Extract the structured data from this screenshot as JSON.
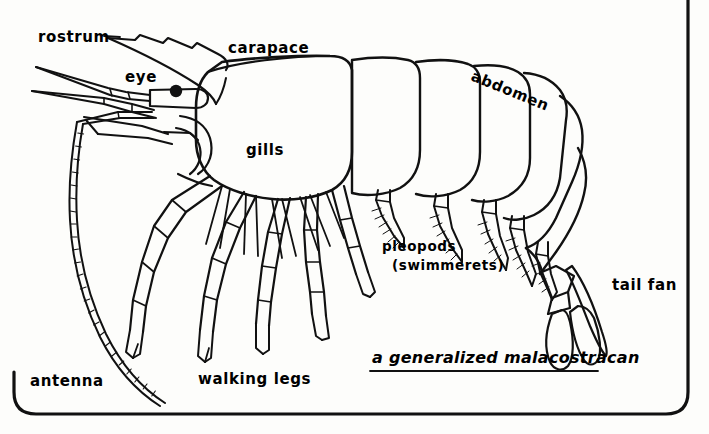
{
  "figure": {
    "caption": "a generalized malacostracan",
    "caption_underlined": true,
    "background_color": "#fdfdfb",
    "ink_color": "#111111",
    "page_border": {
      "visible": true,
      "corner_style": "rounded",
      "color": "#111111"
    }
  },
  "labels": {
    "rostrum": "rostrum",
    "carapace": "carapace",
    "abdomen": "abdomen",
    "eye": "eye",
    "gills": "gills",
    "pleopods": "pleopods",
    "swimmerets": "(swimmerets)",
    "tail_fan": "tail fan",
    "antenna": "antenna",
    "walking_legs": "walking legs"
  },
  "anatomy": {
    "eye_color": "#111111",
    "walking_leg_count": 5,
    "pleopod_count": 5,
    "abdomen_segment_count": 6,
    "tail_fan_lobe_count": 3,
    "antenna_count": 2,
    "rostrum_serrations": 3
  }
}
